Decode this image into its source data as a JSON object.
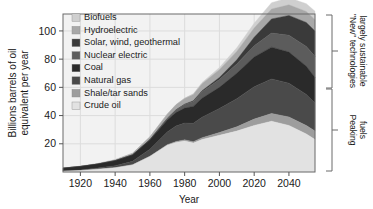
{
  "chart_data": {
    "type": "area",
    "title": "",
    "subtitle": "",
    "xlabel": "Year",
    "ylabel": "Billions barrels of oil equivalent per year",
    "xlim": [
      1910,
      2055
    ],
    "ylim": [
      0,
      112
    ],
    "xticks": [
      1920,
      1940,
      1960,
      1980,
      2000,
      2020,
      2040
    ],
    "yticks": [
      20,
      40,
      60,
      80,
      100
    ],
    "grid": true,
    "legend_position": "upper-left-inside",
    "stacked": true,
    "stack_order_bottom_to_top": [
      "Crude oil",
      "Shale/tar sands",
      "Natural gas",
      "Coal",
      "Nuclear electric",
      "Solar, wind, geothermal",
      "Hydroelectric",
      "Biofuels"
    ],
    "x": [
      1910,
      1920,
      1930,
      1940,
      1950,
      1960,
      1970,
      1975,
      1980,
      1985,
      1990,
      2000,
      2010,
      2020,
      2030,
      2040,
      2050,
      2055
    ],
    "series": [
      {
        "name": "Crude oil",
        "color": "#e2e2e2",
        "values": [
          0.5,
          1.0,
          2.0,
          3.0,
          5.0,
          11.0,
          19.0,
          21.0,
          22.0,
          20.5,
          23.0,
          26.0,
          29.0,
          33.0,
          36.0,
          33.0,
          27.0,
          23.0
        ]
      },
      {
        "name": "Shale/tar sands",
        "color": "#9d9d9d",
        "values": [
          0.0,
          0.0,
          0.0,
          0.0,
          0.1,
          0.2,
          0.4,
          0.6,
          0.8,
          1.0,
          1.3,
          2.0,
          3.0,
          4.5,
          5.5,
          6.0,
          6.0,
          6.0
        ]
      },
      {
        "name": "Natural gas",
        "color": "#4a4a4a",
        "values": [
          0.2,
          0.4,
          0.8,
          1.5,
          2.5,
          5.0,
          9.0,
          11.0,
          12.0,
          13.0,
          14.5,
          17.0,
          20.0,
          23.0,
          24.5,
          24.0,
          22.0,
          20.0
        ]
      },
      {
        "name": "Coal",
        "color": "#2a2a2a",
        "values": [
          2.0,
          2.5,
          2.8,
          3.5,
          4.5,
          6.5,
          8.5,
          9.5,
          10.5,
          12.0,
          13.5,
          15.0,
          18.0,
          21.0,
          22.5,
          22.0,
          20.0,
          18.0
        ]
      },
      {
        "name": "Nuclear electric",
        "color": "#5c5c5c",
        "values": [
          0.0,
          0.0,
          0.0,
          0.0,
          0.0,
          0.2,
          1.0,
          1.8,
          2.5,
          3.5,
          4.5,
          5.5,
          6.5,
          8.0,
          10.0,
          12.0,
          14.0,
          15.0
        ]
      },
      {
        "name": "Solar, wind, geothermal",
        "color": "#3a3a3a",
        "values": [
          0.0,
          0.0,
          0.0,
          0.0,
          0.0,
          0.0,
          0.1,
          0.2,
          0.3,
          0.5,
          0.8,
          1.5,
          3.0,
          6.0,
          10.0,
          14.0,
          17.0,
          18.0
        ]
      },
      {
        "name": "Hydroelectric",
        "color": "#a8a8a8",
        "values": [
          0.1,
          0.2,
          0.4,
          0.7,
          1.2,
          2.0,
          3.0,
          3.5,
          4.0,
          4.5,
          5.0,
          5.5,
          6.0,
          6.5,
          7.0,
          7.5,
          7.8,
          8.0
        ]
      },
      {
        "name": "Biofuels",
        "color": "#cfcfcf",
        "values": [
          0.0,
          0.0,
          0.0,
          0.0,
          0.0,
          0.0,
          0.1,
          0.2,
          0.3,
          0.5,
          0.8,
          1.5,
          2.5,
          3.5,
          4.5,
          5.0,
          5.5,
          6.0
        ]
      }
    ],
    "annotations": [
      {
        "text_line_1": "\"New\" technologies",
        "text_line_2": "largely sustainable",
        "bracket": "upper-right"
      },
      {
        "text_line_1": "Peaking",
        "text_line_2": "fuels",
        "bracket": "lower-right"
      }
    ]
  },
  "axes": {
    "ylabel_line_1": "Billions barrels of oil",
    "ylabel_line_2": "equivalent per year",
    "xlabel": "Year",
    "xticks": [
      "1920",
      "1940",
      "1960",
      "1980",
      "2000",
      "2020",
      "2040"
    ],
    "yticks": [
      "100",
      "80",
      "60",
      "40",
      "20"
    ]
  },
  "legend": {
    "items": [
      {
        "label": "Biofuels",
        "color": "#cfcfcf"
      },
      {
        "label": "Hydroelectric",
        "color": "#a8a8a8"
      },
      {
        "label": "Solar, wind, geothermal",
        "color": "#3a3a3a"
      },
      {
        "label": "Nuclear electric",
        "color": "#5c5c5c"
      },
      {
        "label": "Coal",
        "color": "#2a2a2a"
      },
      {
        "label": "Natural gas",
        "color": "#4a4a4a"
      },
      {
        "label": "Shale/tar sands",
        "color": "#9d9d9d"
      },
      {
        "label": "Crude oil",
        "color": "#e2e2e2"
      }
    ]
  },
  "braces": {
    "upper": {
      "line1": "\"New\" technologies",
      "line2": "largely sustainable"
    },
    "lower": {
      "line1": "Peaking",
      "line2": "fuels"
    }
  },
  "style": {
    "plot_background": "#f2f2f2",
    "axis_color": "#555555",
    "grid_color": "#dcdcdc",
    "text_color": "#1a1a1a"
  }
}
